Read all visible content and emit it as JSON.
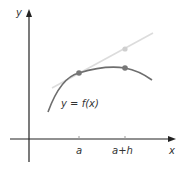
{
  "diagram": {
    "axes": {
      "x_label": "x",
      "y_label": "y"
    },
    "curve_label": "y = f(x)",
    "ticks": [
      {
        "label": "a"
      },
      {
        "label": "a+h"
      }
    ],
    "colors": {
      "axis": "#222222",
      "curve": "#6e6e6e",
      "secant": "#dcdcdc",
      "point": "#777777",
      "point_light": "#cfcfcf",
      "text": "#333333"
    }
  }
}
